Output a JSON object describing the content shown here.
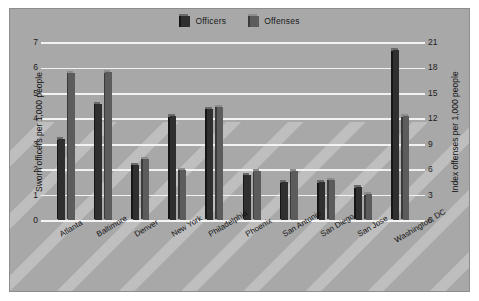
{
  "chart_data": {
    "type": "bar",
    "title": "",
    "categories": [
      "Atlanta",
      "Baltimore",
      "Denver",
      "New York",
      "Philadelphia",
      "Phoenix",
      "San Antonio",
      "San Diego",
      "San Jose",
      "Washington, DC"
    ],
    "series": [
      {
        "name": "Officers",
        "axis": "left",
        "values": [
          3.3,
          4.7,
          2.3,
          4.2,
          4.5,
          1.9,
          1.6,
          1.6,
          1.4,
          6.8
        ]
      },
      {
        "name": "Offenses",
        "axis": "right",
        "values": [
          17.7,
          17.8,
          7.6,
          6.3,
          13.7,
          6.1,
          6.1,
          5.1,
          3.4,
          12.6
        ]
      }
    ],
    "offenses_left_scale_equivalent": [
      5.9,
      5.93,
      2.53,
      2.1,
      4.57,
      2.03,
      2.03,
      1.7,
      1.13,
      4.2
    ],
    "xlabel": "",
    "ylabel_left": "Sworn officers per 1,000 people",
    "ylabel_right": "Index offenses per 1,000 people",
    "ylim_left": [
      0,
      7
    ],
    "ylim_right": [
      0,
      21
    ],
    "yticks_left": [
      "0",
      "1",
      "2",
      "3",
      "4",
      "5",
      "6",
      "7"
    ],
    "yticks_right": [
      "0",
      "3",
      "6",
      "9",
      "12",
      "15",
      "18",
      "21"
    ],
    "grid": true,
    "legend_position": "top-center",
    "colors": {
      "officers": "#2f2f2f",
      "officers_top": "#6a6a6a",
      "officers_side": "#151515",
      "offenses": "#5c5c5c",
      "offenses_top": "#8c8c8c",
      "offenses_side": "#3a3a3a",
      "panel_background": "#a8a8a8",
      "gridline": "#f2f2f2",
      "text": "#141414",
      "page_background": "#ffffff"
    }
  },
  "legend": {
    "items": [
      {
        "label": "Officers"
      },
      {
        "label": "Offenses"
      }
    ]
  }
}
